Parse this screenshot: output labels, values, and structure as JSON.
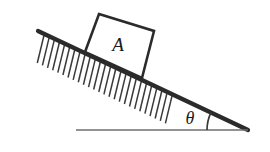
{
  "figure": {
    "type": "physics-diagram",
    "background_color": "#ffffff",
    "width": 270,
    "height": 152
  },
  "labels": {
    "block": "A",
    "angle": "θ"
  },
  "colors": {
    "incline_line": "#2b2b2b",
    "block_outline": "#2b2b2b",
    "baseline": "#6e6e6e",
    "hatch": "#3a3a3a",
    "arc": "#3a3a3a",
    "text": "#1a1a1a"
  },
  "geometry": {
    "incline": {
      "top_x": 38,
      "top_y": 31,
      "vertex_x": 248,
      "vertex_y": 130,
      "stroke_width": 4.2,
      "angle_degrees": 25
    },
    "baseline": {
      "left_x": 76,
      "right_x": 248,
      "y": 130,
      "stroke_width": 1.6
    },
    "block": {
      "top_left_x": 99,
      "top_left_y": 14,
      "top_right_x": 154,
      "top_right_y": 31,
      "bottom_right_x": 142,
      "bottom_right_y": 78,
      "bottom_left_x": 85,
      "bottom_left_y": 52,
      "stroke_width": 2.6,
      "label_x": 118,
      "label_y": 51
    },
    "hatching": {
      "start_t": 0.03,
      "end_t": 0.64,
      "count": 26,
      "length": 30,
      "dx": -7,
      "dy": 29,
      "stroke_width": 1.5
    },
    "angle_arc": {
      "center_x": 248,
      "center_y": 130,
      "radius": 41,
      "stroke_width": 1.7
    },
    "angle_label": {
      "x": 184,
      "y": 124
    }
  }
}
